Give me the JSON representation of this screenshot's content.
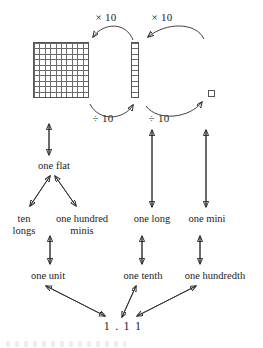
{
  "diagram": {
    "operations": {
      "multiply_left": "× 10",
      "multiply_right": "× 10",
      "divide_left": "÷ 10",
      "divide_right": "÷ 10"
    },
    "blocks": [
      {
        "name": "flat-block",
        "shape": "10x10 grid square",
        "columns": 10,
        "rows": 10
      },
      {
        "name": "long-block",
        "shape": "1x10 vertical rod",
        "columns": 1,
        "rows": 10
      },
      {
        "name": "mini-block",
        "shape": "1x1 unit square",
        "columns": 1,
        "rows": 1
      }
    ],
    "labels": {
      "one_flat": "one flat",
      "ten_longs_line1": "ten",
      "ten_longs_line2": "longs",
      "one_hundred_minis_line1": "one hundred",
      "one_hundred_minis_line2": "minis",
      "one_long": "one long",
      "one_mini": "one mini",
      "one_unit": "one unit",
      "one_tenth": "one tenth",
      "one_hundredth": "one hundredth",
      "decimal_value": "1 . 1 1"
    },
    "colors": {
      "ink": "#232323",
      "grid_line": "#6b6b6b",
      "block_border": "#555555",
      "arrow": "#2b2b2b",
      "background": "#ffffff"
    }
  }
}
